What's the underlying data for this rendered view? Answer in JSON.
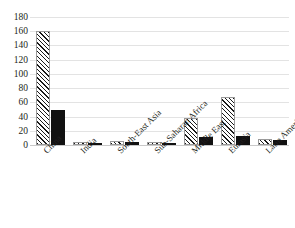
{
  "chart_data": {
    "type": "bar",
    "title": "",
    "xlabel": "",
    "ylabel": "",
    "ylim": [
      0,
      180
    ],
    "ytick_step": 20,
    "yticks": [
      180,
      160,
      140,
      120,
      100,
      80,
      60,
      40,
      20,
      0
    ],
    "grid": true,
    "legend": "none",
    "categories": [
      "China",
      "India",
      "South-East Asia",
      "Sub-Saharan Africa",
      "Middle East",
      "Eurasia",
      "Latin America"
    ],
    "series": [
      {
        "name": "series-1",
        "style": "hatched",
        "color": "#ffffff",
        "pattern": "diagonal-stripes",
        "values": [
          160,
          4,
          6,
          4,
          38,
          68,
          8
        ]
      },
      {
        "name": "series-2",
        "style": "solid",
        "color": "#111111",
        "values": [
          49,
          3,
          4,
          3,
          11,
          13,
          7
        ]
      }
    ]
  },
  "axis": {
    "gridline_color": "#e3e3e3",
    "baseline_color": "#c9c9c9",
    "tick_text_color": "#231f20"
  }
}
